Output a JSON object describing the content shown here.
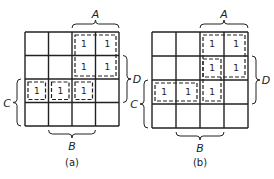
{
  "maps": [
    {
      "id": "a",
      "caption": "(a)",
      "labels": {
        "A": "A",
        "B": "B",
        "C": "C",
        "D": "D"
      },
      "cells": [
        [
          "",
          "",
          "1",
          "1"
        ],
        [
          "",
          "",
          "1",
          "1"
        ],
        [
          "1",
          "1",
          "1",
          ""
        ],
        [
          "",
          "",
          "",
          ""
        ]
      ],
      "groups": [
        {
          "desc": "2x2 top right",
          "r0": 0,
          "c0": 2,
          "r1": 1,
          "c1": 3
        },
        {
          "desc": "row 3 col 1",
          "r0": 2,
          "c0": 0,
          "r1": 2,
          "c1": 0
        },
        {
          "desc": "row 3 col 2",
          "r0": 2,
          "c0": 1,
          "r1": 2,
          "c1": 1
        },
        {
          "desc": "row 3 col 3",
          "r0": 2,
          "c0": 2,
          "r1": 2,
          "c1": 2
        }
      ]
    },
    {
      "id": "b",
      "caption": "(b)",
      "labels": {
        "A": "A",
        "B": "B",
        "C": "C",
        "D": "D"
      },
      "cells": [
        [
          "",
          "",
          "1",
          "1"
        ],
        [
          "",
          "",
          "1",
          "1"
        ],
        [
          "1",
          "1",
          "1",
          ""
        ],
        [
          "",
          "",
          "",
          ""
        ]
      ],
      "groups": [
        {
          "desc": "2x2 top right",
          "r0": 0,
          "c0": 2,
          "r1": 1,
          "c1": 3
        },
        {
          "desc": "col 3 rows 2-3",
          "r0": 1,
          "c0": 2,
          "r1": 2,
          "c1": 2
        },
        {
          "desc": "row 3 cols 1-2",
          "r0": 2,
          "c0": 0,
          "r1": 2,
          "c1": 1
        }
      ]
    }
  ]
}
